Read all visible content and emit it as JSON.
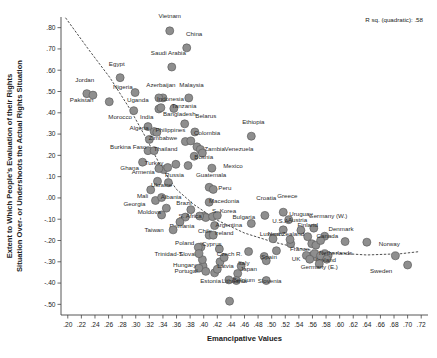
{
  "chart_data": {
    "type": "scatter",
    "title": "",
    "xlabel": "Emancipative Values",
    "ylabel": "Extent to Which People's Evaluation of their Rights Situation Over- or Undershoots the Actual Rights Situation",
    "ylabel_line1": "Extent to Which People's Evaluation of their Rights",
    "ylabel_line2": "Situation Over- or Undershoots the Actual Rights Situation",
    "annotation": "R sq. (quadratic): .58",
    "grid": false,
    "legend": "none",
    "xlim": [
      0.19,
      0.73
    ],
    "ylim": [
      -0.55,
      0.85
    ],
    "xticks": [
      ".20",
      ".22",
      ".24",
      ".26",
      ".28",
      ".30",
      ".32",
      ".34",
      ".36",
      ".38",
      ".40",
      ".42",
      ".44",
      ".46",
      ".48",
      ".50",
      ".52",
      ".54",
      ".56",
      ".58",
      ".60",
      ".62",
      ".64",
      ".66",
      ".68",
      ".70",
      ".72"
    ],
    "xtick_values": [
      0.2,
      0.22,
      0.24,
      0.26,
      0.28,
      0.3,
      0.32,
      0.34,
      0.36,
      0.38,
      0.4,
      0.42,
      0.44,
      0.46,
      0.48,
      0.5,
      0.52,
      0.54,
      0.56,
      0.58,
      0.6,
      0.62,
      0.64,
      0.66,
      0.68,
      0.7,
      0.72
    ],
    "yticks": [
      ".80",
      ".70",
      ".60",
      ".50",
      ".40",
      ".30",
      ".20",
      ".10",
      ".00",
      "-.10",
      "-.20",
      "-.30",
      "-.40",
      "-.50"
    ],
    "ytick_values": [
      0.8,
      0.7,
      0.6,
      0.5,
      0.4,
      0.3,
      0.2,
      0.1,
      0.0,
      -0.1,
      -0.2,
      -0.3,
      -0.4,
      -0.5
    ],
    "marker_color": "#8e8e8e",
    "marker_edge_color": "#5f5f5f",
    "fitline_style": "dashed",
    "points": [
      {
        "label": "Vietnam",
        "x": 0.35,
        "y": 0.785,
        "lx": 0.35,
        "ly": 0.845,
        "anchor": "middle"
      },
      {
        "label": "China",
        "x": 0.375,
        "y": 0.705,
        "lx": 0.386,
        "ly": 0.762,
        "anchor": "middle"
      },
      {
        "label": "Saudi Arabia",
        "x": 0.353,
        "y": 0.615,
        "lx": 0.348,
        "ly": 0.672,
        "anchor": "middle"
      },
      {
        "label": "Egypt",
        "x": 0.277,
        "y": 0.565,
        "lx": 0.272,
        "ly": 0.622,
        "anchor": "middle"
      },
      {
        "label": "Jordan",
        "x": 0.228,
        "y": 0.49,
        "lx": 0.225,
        "ly": 0.545,
        "anchor": "middle"
      },
      {
        "label": "Pakistan",
        "x": 0.237,
        "y": 0.483,
        "lx": 0.203,
        "ly": 0.45,
        "anchor": "start"
      },
      {
        "label": "Nigeria",
        "x": 0.299,
        "y": 0.495,
        "lx": 0.281,
        "ly": 0.513,
        "anchor": "middle"
      },
      {
        "label": "Uganda",
        "x": 0.261,
        "y": 0.452,
        "lx": 0.303,
        "ly": 0.453,
        "anchor": "middle"
      },
      {
        "label": "Azerbaijan",
        "x": 0.334,
        "y": 0.47,
        "lx": 0.337,
        "ly": 0.52,
        "anchor": "middle"
      },
      {
        "label": "Malaysia",
        "x": 0.378,
        "y": 0.47,
        "lx": 0.382,
        "ly": 0.52,
        "anchor": "middle"
      },
      {
        "label": "Indonesia",
        "x": 0.337,
        "y": 0.424,
        "lx": 0.351,
        "ly": 0.456,
        "anchor": "middle"
      },
      {
        "label": "Tanzania",
        "x": 0.356,
        "y": 0.42,
        "lx": 0.371,
        "ly": 0.422,
        "anchor": "middle"
      },
      {
        "label": "Morocco",
        "x": 0.297,
        "y": 0.41,
        "lx": 0.277,
        "ly": 0.373,
        "anchor": "middle"
      },
      {
        "label": "India",
        "x": 0.318,
        "y": 0.335,
        "lx": 0.316,
        "ly": 0.372,
        "anchor": "middle"
      },
      {
        "label": "Bangladesh",
        "x": 0.372,
        "y": 0.348,
        "lx": 0.364,
        "ly": 0.385,
        "anchor": "middle"
      },
      {
        "label": "Belarus",
        "x": 0.387,
        "y": 0.31,
        "lx": 0.403,
        "ly": 0.374,
        "anchor": "middle"
      },
      {
        "label": "Ethiopia",
        "x": 0.47,
        "y": 0.29,
        "lx": 0.473,
        "ly": 0.348,
        "anchor": "middle"
      },
      {
        "label": "Algeria",
        "x": 0.327,
        "y": 0.312,
        "lx": 0.305,
        "ly": 0.318,
        "anchor": "middle"
      },
      {
        "label": "Philippines",
        "x": 0.331,
        "y": 0.308,
        "lx": 0.351,
        "ly": 0.308,
        "anchor": "middle"
      },
      {
        "label": "Colombia",
        "x": 0.381,
        "y": 0.268,
        "lx": 0.405,
        "ly": 0.297,
        "anchor": "middle"
      },
      {
        "label": "Zimbabwe",
        "x": 0.32,
        "y": 0.275,
        "lx": 0.34,
        "ly": 0.272,
        "anchor": "middle"
      },
      {
        "label": "Burkina Faso",
        "x": 0.318,
        "y": 0.222,
        "lx": 0.289,
        "ly": 0.228,
        "anchor": "middle"
      },
      {
        "label": "Thailand",
        "x": 0.327,
        "y": 0.222,
        "lx": 0.344,
        "ly": 0.222,
        "anchor": "middle"
      },
      {
        "label": "Zambia",
        "x": 0.395,
        "y": 0.228,
        "lx": 0.416,
        "ly": 0.222,
        "anchor": "middle"
      },
      {
        "label": "Venezuela",
        "x": 0.398,
        "y": 0.211,
        "lx": 0.452,
        "ly": 0.222,
        "anchor": "middle"
      },
      {
        "label": "Bosnia",
        "x": 0.386,
        "y": 0.196,
        "lx": 0.4,
        "ly": 0.184,
        "anchor": "middle"
      },
      {
        "label": "Ghana",
        "x": 0.31,
        "y": 0.168,
        "lx": 0.291,
        "ly": 0.131,
        "anchor": "middle"
      },
      {
        "label": "Turkey",
        "x": 0.334,
        "y": 0.138,
        "lx": 0.327,
        "ly": 0.153,
        "anchor": "middle"
      },
      {
        "label": "Mexico",
        "x": 0.412,
        "y": 0.14,
        "lx": 0.443,
        "ly": 0.14,
        "anchor": "middle"
      },
      {
        "label": "Armenia",
        "x": 0.332,
        "y": 0.078,
        "lx": 0.311,
        "ly": 0.113,
        "anchor": "middle"
      },
      {
        "label": "Russia",
        "x": 0.348,
        "y": 0.072,
        "lx": 0.357,
        "ly": 0.1,
        "anchor": "middle"
      },
      {
        "label": "Guatemala",
        "x": 0.408,
        "y": 0.05,
        "lx": 0.411,
        "ly": 0.1,
        "anchor": "middle"
      },
      {
        "label": "Ukraine",
        "x": 0.322,
        "y": 0.038,
        "lx": 0.338,
        "ly": 0.05,
        "anchor": "middle"
      },
      {
        "label": "Peru",
        "x": 0.414,
        "y": 0.04,
        "lx": 0.431,
        "ly": 0.035,
        "anchor": "middle"
      },
      {
        "label": "Mali",
        "x": 0.329,
        "y": -0.012,
        "lx": 0.31,
        "ly": -0.002,
        "anchor": "middle"
      },
      {
        "label": "Albania",
        "x": 0.338,
        "y": 0.002,
        "lx": 0.352,
        "ly": -0.005,
        "anchor": "middle"
      },
      {
        "label": "Macedonia",
        "x": 0.408,
        "y": -0.02,
        "lx": 0.43,
        "ly": -0.023,
        "anchor": "middle"
      },
      {
        "label": "Croatia",
        "x": 0.49,
        "y": -0.082,
        "lx": 0.492,
        "ly": -0.008,
        "anchor": "middle"
      },
      {
        "label": "Greece",
        "x": 0.517,
        "y": -0.067,
        "lx": 0.523,
        "ly": 0.0,
        "anchor": "middle"
      },
      {
        "label": "Georgia",
        "x": 0.345,
        "y": -0.048,
        "lx": 0.298,
        "ly": -0.04,
        "anchor": "middle"
      },
      {
        "label": "Brazil",
        "x": 0.381,
        "y": -0.055,
        "lx": 0.371,
        "ly": -0.035,
        "anchor": "middle"
      },
      {
        "label": "Moldova",
        "x": 0.338,
        "y": -0.08,
        "lx": 0.32,
        "ly": -0.075,
        "anchor": "middle"
      },
      {
        "label": "S. Africa",
        "x": 0.394,
        "y": -0.085,
        "lx": 0.38,
        "ly": -0.095,
        "anchor": "middle"
      },
      {
        "label": "S. Korea",
        "x": 0.42,
        "y": -0.082,
        "lx": 0.43,
        "ly": -0.07,
        "anchor": "middle"
      },
      {
        "label": "Bulgaria",
        "x": 0.47,
        "y": -0.12,
        "lx": 0.459,
        "ly": -0.1,
        "anchor": "middle"
      },
      {
        "label": "Uruguay",
        "x": 0.525,
        "y": -0.102,
        "lx": 0.543,
        "ly": -0.085,
        "anchor": "middle"
      },
      {
        "label": "Germany (W.)",
        "x": 0.562,
        "y": -0.142,
        "lx": 0.583,
        "ly": -0.095,
        "anchor": "middle"
      },
      {
        "label": "Austria",
        "x": 0.543,
        "y": -0.152,
        "lx": 0.538,
        "ly": -0.112,
        "anchor": "middle"
      },
      {
        "label": "U.S.A.",
        "x": 0.517,
        "y": -0.15,
        "lx": 0.514,
        "ly": -0.12,
        "anchor": "middle"
      },
      {
        "label": "Romania",
        "x": 0.365,
        "y": -0.113,
        "lx": 0.368,
        "ly": -0.14,
        "anchor": "middle"
      },
      {
        "label": "Taiwan",
        "x": 0.355,
        "y": -0.15,
        "lx": 0.327,
        "ly": -0.16,
        "anchor": "middle"
      },
      {
        "label": "Argentina",
        "x": 0.416,
        "y": -0.13,
        "lx": 0.437,
        "ly": -0.135,
        "anchor": "middle"
      },
      {
        "label": "Finland",
        "x": 0.553,
        "y": -0.182,
        "lx": 0.553,
        "ly": -0.135,
        "anchor": "middle"
      },
      {
        "label": "Denmark",
        "x": 0.578,
        "y": -0.18,
        "lx": 0.602,
        "ly": -0.155,
        "anchor": "middle"
      },
      {
        "label": "Chile",
        "x": 0.408,
        "y": -0.175,
        "lx": 0.402,
        "ly": -0.165,
        "anchor": "middle"
      },
      {
        "label": "Ireland",
        "x": 0.414,
        "y": -0.175,
        "lx": 0.43,
        "ly": -0.172,
        "anchor": "middle"
      },
      {
        "label": "New Zealand",
        "x": 0.527,
        "y": -0.195,
        "lx": 0.521,
        "ly": -0.18,
        "anchor": "middle"
      },
      {
        "label": "Canada",
        "x": 0.572,
        "y": -0.2,
        "lx": 0.582,
        "ly": -0.19,
        "anchor": "middle"
      },
      {
        "label": "Luxemb.",
        "x": 0.502,
        "y": -0.192,
        "lx": 0.5,
        "ly": -0.18,
        "anchor": "middle"
      },
      {
        "label": "Poland",
        "x": 0.392,
        "y": -0.232,
        "lx": 0.372,
        "ly": -0.222,
        "anchor": "middle"
      },
      {
        "label": "Cyprus",
        "x": 0.423,
        "y": -0.24,
        "lx": 0.412,
        "ly": -0.228,
        "anchor": "middle"
      },
      {
        "label": "Norway",
        "x": 0.682,
        "y": -0.272,
        "lx": 0.673,
        "ly": -0.225,
        "anchor": "middle"
      },
      {
        "label": "France",
        "x": 0.551,
        "y": -0.27,
        "lx": 0.541,
        "ly": -0.25,
        "anchor": "middle"
      },
      {
        "label": "Netherlands",
        "x": 0.572,
        "y": -0.272,
        "lx": 0.594,
        "ly": -0.27,
        "anchor": "middle"
      },
      {
        "label": "Slovakia",
        "x": 0.398,
        "y": -0.29,
        "lx": 0.381,
        "ly": -0.275,
        "anchor": "middle"
      },
      {
        "label": "Trinidad-T.",
        "x": 0.393,
        "y": -0.262,
        "lx": 0.349,
        "ly": -0.272,
        "anchor": "middle"
      },
      {
        "label": "Czech R.",
        "x": 0.43,
        "y": -0.28,
        "lx": 0.438,
        "ly": -0.275,
        "anchor": "middle"
      },
      {
        "label": "Spain",
        "x": 0.492,
        "y": -0.295,
        "lx": 0.496,
        "ly": -0.288,
        "anchor": "middle"
      },
      {
        "label": "UK",
        "x": 0.556,
        "y": -0.288,
        "lx": 0.536,
        "ly": -0.297,
        "anchor": "middle"
      },
      {
        "label": "Iceland",
        "x": 0.581,
        "y": -0.288,
        "lx": 0.58,
        "ly": -0.302,
        "anchor": "middle"
      },
      {
        "label": "Hungary",
        "x": 0.393,
        "y": -0.33,
        "lx": 0.372,
        "ly": -0.325,
        "anchor": "middle"
      },
      {
        "label": "Latvia",
        "x": 0.42,
        "y": -0.335,
        "lx": 0.432,
        "ly": -0.33,
        "anchor": "middle"
      },
      {
        "label": "Italy",
        "x": 0.455,
        "y": -0.32,
        "lx": 0.459,
        "ly": -0.315,
        "anchor": "middle"
      },
      {
        "label": "Portugal",
        "x": 0.403,
        "y": -0.345,
        "lx": 0.374,
        "ly": -0.355,
        "anchor": "middle"
      },
      {
        "label": "Japan",
        "x": 0.45,
        "y": -0.355,
        "lx": 0.466,
        "ly": -0.345,
        "anchor": "middle"
      },
      {
        "label": "Germany (E.)",
        "x": 0.57,
        "y": -0.31,
        "lx": 0.57,
        "ly": -0.335,
        "anchor": "middle"
      },
      {
        "label": "Sweden",
        "x": 0.7,
        "y": -0.315,
        "lx": 0.661,
        "ly": -0.352,
        "anchor": "middle"
      },
      {
        "label": "Belgium",
        "x": 0.448,
        "y": -0.388,
        "lx": 0.459,
        "ly": -0.395,
        "anchor": "middle"
      },
      {
        "label": "Slovenia",
        "x": 0.492,
        "y": -0.388,
        "lx": 0.497,
        "ly": -0.398,
        "anchor": "middle"
      },
      {
        "label": "Estonia",
        "x": 0.437,
        "y": -0.385,
        "lx": 0.41,
        "ly": -0.4,
        "anchor": "middle"
      },
      {
        "label": "Lithuania",
        "x": 0.438,
        "y": -0.485,
        "lx": 0.445,
        "ly": -0.4,
        "anchor": "middle"
      }
    ],
    "extra_markers": [
      {
        "x": 0.34,
        "y": 0.47
      },
      {
        "x": 0.334,
        "y": 0.418
      },
      {
        "x": 0.373,
        "y": -0.09
      },
      {
        "x": 0.4,
        "y": -0.085
      },
      {
        "x": 0.403,
        "y": -0.092
      },
      {
        "x": 0.413,
        "y": -0.088
      },
      {
        "x": 0.396,
        "y": -0.23
      },
      {
        "x": 0.399,
        "y": -0.32
      },
      {
        "x": 0.416,
        "y": -0.352
      },
      {
        "x": 0.424,
        "y": -0.3
      },
      {
        "x": 0.489,
        "y": -0.275
      },
      {
        "x": 0.56,
        "y": -0.27
      },
      {
        "x": 0.566,
        "y": -0.278
      },
      {
        "x": 0.563,
        "y": -0.262
      },
      {
        "x": 0.578,
        "y": -0.262
      },
      {
        "x": 0.583,
        "y": -0.272
      },
      {
        "x": 0.559,
        "y": -0.215
      },
      {
        "x": 0.565,
        "y": -0.222
      },
      {
        "x": 0.608,
        "y": -0.205
      },
      {
        "x": 0.64,
        "y": -0.208
      },
      {
        "x": 0.528,
        "y": -0.215
      },
      {
        "x": 0.507,
        "y": -0.248
      },
      {
        "x": 0.466,
        "y": -0.252
      },
      {
        "x": 0.341,
        "y": 0.133
      },
      {
        "x": 0.347,
        "y": 0.143
      },
      {
        "x": 0.359,
        "y": 0.158
      },
      {
        "x": 0.377,
        "y": 0.152
      },
      {
        "x": 0.39,
        "y": 0.24
      },
      {
        "x": 0.373,
        "y": 0.265
      }
    ],
    "fitline_points": [
      {
        "x": 0.197,
        "y": 0.845
      },
      {
        "x": 0.23,
        "y": 0.7
      },
      {
        "x": 0.262,
        "y": 0.565
      },
      {
        "x": 0.292,
        "y": 0.415
      },
      {
        "x": 0.318,
        "y": 0.265
      },
      {
        "x": 0.338,
        "y": 0.14
      },
      {
        "x": 0.36,
        "y": 0.04
      },
      {
        "x": 0.385,
        "y": -0.03
      },
      {
        "x": 0.42,
        "y": -0.105
      },
      {
        "x": 0.46,
        "y": -0.165
      },
      {
        "x": 0.5,
        "y": -0.205
      },
      {
        "x": 0.545,
        "y": -0.24
      },
      {
        "x": 0.59,
        "y": -0.258
      },
      {
        "x": 0.64,
        "y": -0.268
      },
      {
        "x": 0.69,
        "y": -0.262
      },
      {
        "x": 0.718,
        "y": -0.252
      }
    ]
  }
}
